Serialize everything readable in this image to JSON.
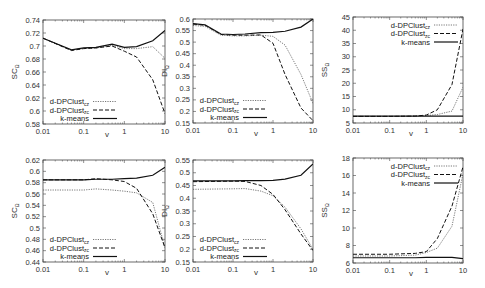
{
  "figure": {
    "layout": "2x3 grid of line plots",
    "series_styles": {
      "d-DPClust_cz": {
        "dash": "1.2,1.2",
        "width": 0.8,
        "color": "#555555"
      },
      "d-DPClust_zc": {
        "dash": "4,2",
        "width": 1.0,
        "color": "#111111"
      },
      "k-means": {
        "dash": "",
        "width": 1.2,
        "color": "#111111"
      }
    }
  },
  "chart_data": [
    {
      "id": "top-left",
      "type": "line",
      "frame": {
        "x0": 43,
        "x1": 165,
        "y0": 20,
        "y1": 124
      },
      "xlabel": "v",
      "ylabel": "SC",
      "ylabel_sub": "Ω",
      "xscale": "log",
      "xlim": [
        0.01,
        10
      ],
      "ylim": [
        0.58,
        0.74
      ],
      "xticks": [
        0.01,
        0.1,
        1,
        10
      ],
      "xtick_labels": [
        "0.01",
        "0.1",
        "1",
        "10"
      ],
      "yticks": [
        0.58,
        0.6,
        0.62,
        0.64,
        0.66,
        0.68,
        0.7,
        0.72,
        0.74
      ],
      "ytick_labels": [
        "0.58",
        "0.6",
        "0.62",
        "0.64",
        "0.66",
        "0.68",
        "0.7",
        "0.72",
        "0.74"
      ],
      "legend": {
        "position": "lower-left",
        "entries": [
          "d-DPClust",
          "d-DPClust",
          "k-means"
        ],
        "subs": [
          "cz",
          "zc",
          ""
        ]
      },
      "x": [
        0.01,
        0.05,
        0.1,
        0.2,
        0.5,
        1,
        2,
        5,
        10
      ],
      "series": [
        {
          "name": "d-DPClust_cz",
          "values": [
            0.712,
            0.694,
            0.696,
            0.697,
            0.701,
            0.696,
            0.696,
            0.699,
            0.681
          ]
        },
        {
          "name": "d-DPClust_zc",
          "values": [
            0.712,
            0.693,
            0.696,
            0.697,
            0.7,
            0.692,
            0.683,
            0.648,
            0.596
          ]
        },
        {
          "name": "k-means",
          "values": [
            0.712,
            0.694,
            0.697,
            0.698,
            0.703,
            0.698,
            0.699,
            0.708,
            0.724
          ]
        }
      ]
    },
    {
      "id": "top-middle",
      "type": "line",
      "frame": {
        "x0": 193,
        "x1": 313,
        "y0": 19,
        "y1": 123
      },
      "xlabel": "v",
      "ylabel": "DI",
      "ylabel_sub": "Ω",
      "xscale": "log",
      "xlim": [
        0.01,
        10
      ],
      "ylim": [
        0.15,
        0.6
      ],
      "xticks": [
        0.01,
        0.1,
        1,
        10
      ],
      "xtick_labels": [
        "0.01",
        "0.1",
        "1",
        "10"
      ],
      "yticks": [
        0.15,
        0.2,
        0.25,
        0.3,
        0.35,
        0.4,
        0.45,
        0.5,
        0.55,
        0.6
      ],
      "ytick_labels": [
        "0.15",
        "0.2",
        "0.25",
        "0.3",
        "0.35",
        "0.4",
        "0.45",
        "0.5",
        "0.55",
        "0.6"
      ],
      "legend": {
        "position": "lower-left",
        "entries": [
          "d-DPClust",
          "d-DPClust",
          "k-means"
        ],
        "subs": [
          "cz",
          "zc",
          ""
        ]
      },
      "x": [
        0.01,
        0.02,
        0.05,
        0.1,
        0.2,
        0.5,
        1,
        2,
        5,
        10
      ],
      "series": [
        {
          "name": "d-DPClust_cz",
          "values": [
            0.572,
            0.568,
            0.53,
            0.527,
            0.527,
            0.53,
            0.525,
            0.487,
            0.36,
            0.235
          ]
        },
        {
          "name": "d-DPClust_zc",
          "values": [
            0.578,
            0.573,
            0.533,
            0.53,
            0.53,
            0.531,
            0.495,
            0.36,
            0.215,
            0.16
          ]
        },
        {
          "name": "k-means",
          "values": [
            0.58,
            0.575,
            0.535,
            0.533,
            0.535,
            0.541,
            0.542,
            0.547,
            0.565,
            0.6
          ]
        }
      ]
    },
    {
      "id": "top-right",
      "type": "line",
      "frame": {
        "x0": 353,
        "x1": 463,
        "y0": 17,
        "y1": 123
      },
      "xlabel": "v",
      "ylabel": "SS",
      "ylabel_sub": "Ω",
      "xscale": "log",
      "xlim": [
        0.01,
        10
      ],
      "ylim": [
        5,
        45
      ],
      "xticks": [
        0.01,
        0.1,
        1,
        10
      ],
      "xtick_labels": [
        "0.01",
        "0.1",
        "1",
        "10"
      ],
      "yticks": [
        5,
        10,
        15,
        20,
        25,
        30,
        35,
        40,
        45
      ],
      "ytick_labels": [
        "5",
        "10",
        "15",
        "20",
        "25",
        "30",
        "35",
        "40",
        "45"
      ],
      "legend": {
        "position": "upper-right",
        "entries": [
          "d-DPClust",
          "d-DPClust",
          "k-means"
        ],
        "subs": [
          "cz",
          "zc",
          ""
        ]
      },
      "x": [
        0.01,
        0.1,
        0.5,
        1,
        2,
        5,
        10
      ],
      "series": [
        {
          "name": "d-DPClust_cz",
          "values": [
            7.5,
            7.5,
            7.6,
            7.8,
            8.2,
            9.5,
            18.5
          ]
        },
        {
          "name": "d-DPClust_zc",
          "values": [
            7.5,
            7.5,
            7.6,
            8.0,
            10.0,
            19.5,
            40.5
          ]
        },
        {
          "name": "k-means",
          "values": [
            7.6,
            7.6,
            7.6,
            7.6,
            7.6,
            7.6,
            7.6
          ]
        }
      ]
    },
    {
      "id": "bottom-left",
      "type": "line",
      "frame": {
        "x0": 43,
        "x1": 165,
        "y0": 160,
        "y1": 262
      },
      "xlabel": "v",
      "ylabel": "SC",
      "ylabel_sub": "Ω",
      "xscale": "log",
      "xlim": [
        0.01,
        10
      ],
      "ylim": [
        0.44,
        0.62
      ],
      "xticks": [
        0.01,
        0.1,
        1,
        10
      ],
      "xtick_labels": [
        "0.01",
        "0.1",
        "1",
        "10"
      ],
      "yticks": [
        0.44,
        0.46,
        0.48,
        0.5,
        0.52,
        0.54,
        0.56,
        0.58,
        0.6,
        0.62
      ],
      "ytick_labels": [
        "0.44",
        "0.46",
        "0.48",
        "0.5",
        "0.52",
        "0.54",
        "0.56",
        "0.58",
        "0.6",
        "0.62"
      ],
      "legend": {
        "position": "lower-left",
        "entries": [
          "d-DPClust",
          "d-DPClust",
          "k-means"
        ],
        "subs": [
          "cz",
          "zc",
          ""
        ]
      },
      "x": [
        0.01,
        0.05,
        0.1,
        0.2,
        0.5,
        1,
        2,
        5,
        10
      ],
      "series": [
        {
          "name": "d-DPClust_cz",
          "values": [
            0.567,
            0.567,
            0.567,
            0.569,
            0.567,
            0.565,
            0.562,
            0.545,
            0.465
          ]
        },
        {
          "name": "d-DPClust_zc",
          "values": [
            0.585,
            0.585,
            0.585,
            0.587,
            0.585,
            0.582,
            0.57,
            0.525,
            0.465
          ]
        },
        {
          "name": "k-means",
          "values": [
            0.585,
            0.585,
            0.585,
            0.586,
            0.586,
            0.587,
            0.588,
            0.593,
            0.607
          ]
        }
      ]
    },
    {
      "id": "bottom-middle",
      "type": "line",
      "frame": {
        "x0": 193,
        "x1": 313,
        "y0": 160,
        "y1": 262
      },
      "xlabel": "v",
      "ylabel": "DI",
      "ylabel_sub": "Ω",
      "xscale": "log",
      "xlim": [
        0.01,
        10
      ],
      "ylim": [
        0.15,
        0.55
      ],
      "xticks": [
        0.01,
        0.1,
        1,
        10
      ],
      "xtick_labels": [
        "0.01",
        "0.1",
        "1",
        "10"
      ],
      "yticks": [
        0.15,
        0.2,
        0.25,
        0.3,
        0.35,
        0.4,
        0.45,
        0.5,
        0.55
      ],
      "ytick_labels": [
        "0.15",
        "0.2",
        "0.25",
        "0.3",
        "0.35",
        "0.4",
        "0.45",
        "0.5",
        "0.55"
      ],
      "legend": {
        "position": "lower-left",
        "entries": [
          "d-DPClust",
          "d-DPClust",
          "k-means"
        ],
        "subs": [
          "cz",
          "zc",
          ""
        ]
      },
      "x": [
        0.01,
        0.1,
        0.2,
        0.5,
        1,
        2,
        5,
        10
      ],
      "series": [
        {
          "name": "d-DPClust_cz",
          "values": [
            0.435,
            0.437,
            0.438,
            0.428,
            0.41,
            0.365,
            0.28,
            0.2
          ]
        },
        {
          "name": "d-DPClust_zc",
          "values": [
            0.465,
            0.467,
            0.466,
            0.45,
            0.415,
            0.355,
            0.26,
            0.195
          ]
        },
        {
          "name": "k-means",
          "values": [
            0.468,
            0.468,
            0.469,
            0.469,
            0.47,
            0.475,
            0.49,
            0.535
          ]
        }
      ]
    },
    {
      "id": "bottom-right",
      "type": "line",
      "frame": {
        "x0": 353,
        "x1": 463,
        "y0": 158,
        "y1": 263
      },
      "xlabel": "v",
      "ylabel": "SS",
      "ylabel_sub": "Ω",
      "xscale": "log",
      "xlim": [
        0.01,
        10
      ],
      "ylim": [
        6,
        18
      ],
      "xticks": [
        0.01,
        0.1,
        1,
        10
      ],
      "xtick_labels": [
        "0.01",
        "0.1",
        "1",
        "10"
      ],
      "yticks": [
        6,
        8,
        10,
        12,
        14,
        16,
        18
      ],
      "ytick_labels": [
        "6",
        "8",
        "10",
        "12",
        "14",
        "16",
        "18"
      ],
      "legend": {
        "position": "upper-right",
        "entries": [
          "d-DPClust",
          "d-DPClust",
          "k-means"
        ],
        "subs": [
          "cz",
          "zc",
          ""
        ]
      },
      "x": [
        0.01,
        0.1,
        0.5,
        1,
        2,
        5,
        10
      ],
      "series": [
        {
          "name": "d-DPClust_cz",
          "values": [
            6.8,
            6.8,
            6.9,
            7.2,
            7.7,
            10.2,
            16.2
          ]
        },
        {
          "name": "d-DPClust_zc",
          "values": [
            7.0,
            7.0,
            7.1,
            7.3,
            8.8,
            12.5,
            17.0
          ]
        },
        {
          "name": "k-means",
          "values": [
            6.6,
            6.6,
            6.6,
            6.65,
            6.65,
            6.65,
            6.5
          ]
        }
      ]
    }
  ]
}
